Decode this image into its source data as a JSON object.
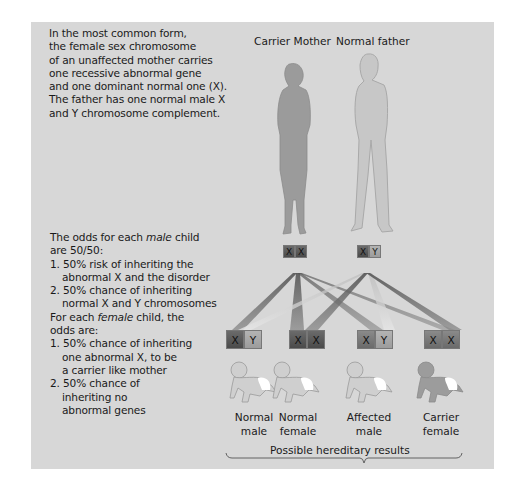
{
  "intro_text": [
    "In the most common form,",
    "the female sex chromosome",
    "of an unaffected mother carries",
    "one recessive abnormal gene",
    "and one dominant normal one (X).",
    "The father has one normal male X",
    "and Y chromosome complement."
  ],
  "parents": {
    "mother": {
      "label": "Carrier Mother",
      "chromosomes": [
        "X",
        "X"
      ],
      "abnormal_index": 1
    },
    "father": {
      "label": "Normal father",
      "chromosomes": [
        "X",
        "Y"
      ]
    }
  },
  "odds": {
    "male_intro_a": "The odds for each ",
    "male_word": "male",
    "male_intro_b": " child",
    "male_intro_c": "are 50/50:",
    "male_items": [
      [
        "1. 50% risk of inheriting the",
        "abnormal X and the disorder"
      ],
      [
        "2. 50% chance of inheriting",
        "normal X and Y chromosomes"
      ]
    ],
    "female_intro_a": "For each ",
    "female_word": "female",
    "female_intro_b": " child, the",
    "female_intro_c": "odds are:",
    "female_items": [
      [
        "1. 50% chance of inheriting",
        "one abnormal X, to be",
        "a carrier like mother"
      ],
      [
        "2. 50% chance of",
        "inheriting no",
        "abnormal genes"
      ]
    ]
  },
  "children": [
    {
      "label_1": "Normal",
      "label_2": "male",
      "chromosomes": [
        "X",
        "Y"
      ]
    },
    {
      "label_1": "Normal",
      "label_2": "female",
      "chromosomes": [
        "X",
        "X"
      ]
    },
    {
      "label_1": "Affected",
      "label_2": "male",
      "chromosomes": [
        "X",
        "Y"
      ]
    },
    {
      "label_1": "Carrier",
      "label_2": "female",
      "chromosomes": [
        "X",
        "X"
      ]
    }
  ],
  "results_label": "Possible hereditary results",
  "colors": {
    "panel_bg": "#d7d7d7",
    "mother": "#9a9a9a",
    "father": "#c6c6c6",
    "dark_chromosome": "#4a4a4a",
    "light_chromosome": "#a8a8a8"
  }
}
